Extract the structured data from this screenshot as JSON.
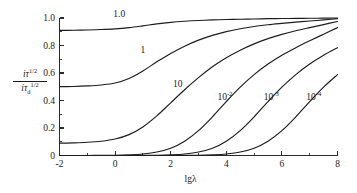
{
  "figure": {
    "background_color": "#ffffff",
    "curve_color": "#1c1c1c",
    "axis_color": "#2b2b2b"
  },
  "axes": {
    "x_title": "lgλ",
    "y_title": {
      "numerator_base": "iτ",
      "numerator_exponent": "1/2",
      "denominator_base": "iτ",
      "denominator_subscript": "d",
      "denominator_exponent": "1/2"
    },
    "x_ticks": [
      "-2",
      "0",
      "2",
      "4",
      "6",
      "8"
    ],
    "y_ticks": [
      "0",
      "0.2",
      "0.4",
      "0.6",
      "0.8",
      "1.0"
    ]
  },
  "chart_data": {
    "type": "line",
    "title": "",
    "xlabel": "lgλ",
    "ylabel": "iτ^(1/2) / iτ_d^(1/2)",
    "xlim": [
      -2,
      8
    ],
    "ylim": [
      0,
      1.0
    ],
    "xticks": [
      -2,
      0,
      2,
      4,
      6,
      8
    ],
    "yticks": [
      0,
      0.2,
      0.4,
      0.6,
      0.8,
      1.0
    ],
    "grid": false,
    "legend": "inline-curve-labels",
    "x": [
      -2,
      -1.5,
      -1,
      -0.5,
      0,
      0.5,
      1,
      1.5,
      2,
      2.5,
      3,
      3.5,
      4,
      4.5,
      5,
      5.5,
      6,
      6.5,
      7,
      7.5,
      8
    ],
    "series": [
      {
        "name": "1.0",
        "label": "1.0",
        "label_x": 0.15,
        "label_y": 1.01,
        "values": [
          0.91,
          0.911,
          0.913,
          0.916,
          0.921,
          0.93,
          0.943,
          0.957,
          0.968,
          0.976,
          0.982,
          0.986,
          0.989,
          0.991,
          0.993,
          0.995,
          0.996,
          0.997,
          0.998,
          0.999,
          1.0
        ]
      },
      {
        "name": "1",
        "label": "1",
        "label_x": 1.0,
        "label_y": 0.745,
        "values": [
          0.5,
          0.502,
          0.506,
          0.513,
          0.527,
          0.56,
          0.615,
          0.681,
          0.742,
          0.795,
          0.839,
          0.874,
          0.901,
          0.922,
          0.938,
          0.951,
          0.961,
          0.97,
          0.978,
          0.986,
          0.995
        ]
      },
      {
        "name": "10",
        "label": "10",
        "label_x": 2.25,
        "label_y": 0.5,
        "values": [
          0.09,
          0.092,
          0.096,
          0.104,
          0.12,
          0.152,
          0.208,
          0.288,
          0.383,
          0.478,
          0.566,
          0.645,
          0.711,
          0.766,
          0.812,
          0.85,
          0.881,
          0.907,
          0.93,
          0.952,
          0.975
        ]
      },
      {
        "name": "10^-2",
        "label_base": "10",
        "label_exponent": "-2",
        "label_x": 3.95,
        "label_y": 0.405,
        "values": [
          0.0,
          0.0,
          0.0,
          0.001,
          0.002,
          0.005,
          0.011,
          0.025,
          0.053,
          0.104,
          0.181,
          0.281,
          0.392,
          0.497,
          0.588,
          0.665,
          0.729,
          0.784,
          0.834,
          0.882,
          0.93
        ]
      },
      {
        "name": "10^-3",
        "label_base": "10",
        "label_exponent": "-3",
        "label_x": 5.62,
        "label_y": 0.405,
        "values": [
          0.0,
          0.0,
          0.0,
          0.0,
          0.0,
          0.0,
          0.001,
          0.002,
          0.005,
          0.011,
          0.025,
          0.053,
          0.104,
          0.181,
          0.281,
          0.392,
          0.497,
          0.588,
          0.665,
          0.729,
          0.784
        ]
      },
      {
        "name": "10^-4",
        "label_base": "10",
        "label_exponent": "-4",
        "label_x": 7.15,
        "label_y": 0.405,
        "values": [
          0.0,
          0.0,
          0.0,
          0.0,
          0.0,
          0.0,
          0.0,
          0.0,
          0.0,
          0.001,
          0.002,
          0.005,
          0.011,
          0.025,
          0.053,
          0.104,
          0.181,
          0.281,
          0.392,
          0.497,
          0.588
        ]
      }
    ]
  }
}
